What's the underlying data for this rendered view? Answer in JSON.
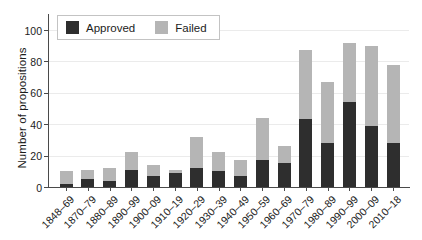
{
  "chart_data": {
    "type": "bar",
    "stacked": true,
    "title": "",
    "xlabel": "",
    "ylabel": "Number of propositions",
    "categories": [
      "1848–69",
      "1870–79",
      "1880–89",
      "1890–99",
      "1900–09",
      "1910–19",
      "1920–29",
      "1930–39",
      "1940–49",
      "1950–59",
      "1960–69",
      "1970–79",
      "1980–89",
      "1990–99",
      "2000–09",
      "2010–18"
    ],
    "series": [
      {
        "name": "Approved",
        "color": "#2e2e2e",
        "values": [
          2,
          5,
          4,
          11,
          7,
          9,
          12,
          10,
          7,
          17,
          15,
          43,
          28,
          54,
          39,
          28
        ]
      },
      {
        "name": "Failed",
        "color": "#b5b5b5",
        "values": [
          8,
          6,
          8,
          11,
          7,
          2,
          20,
          12,
          10,
          27,
          11,
          44,
          39,
          38,
          51,
          50
        ]
      }
    ],
    "totals": [
      10,
      11,
      12,
      22,
      14,
      11,
      32,
      22,
      17,
      44,
      26,
      87,
      67,
      92,
      90,
      78
    ],
    "yticks": [
      0,
      20,
      40,
      60,
      80,
      100
    ],
    "ylim": [
      0,
      110
    ],
    "grid": "horizontal",
    "grid_color": "#ebebeb",
    "axis_color": "#4a4a4a",
    "text_color": "#1c1c1c",
    "legend_position": "top-left"
  }
}
